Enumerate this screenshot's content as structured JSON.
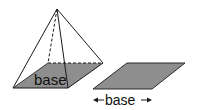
{
  "figure": {
    "pyramid": {
      "base_label": "base",
      "base_fill": "#8e8e8e",
      "edge_color": "#1a1a1a"
    },
    "base_shape": {
      "label": "base",
      "fill": "#8e8e8e",
      "arrow_left": "◂",
      "arrow_right": "▸"
    }
  }
}
